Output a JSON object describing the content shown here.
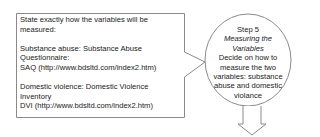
{
  "callout_box": {
    "intro": "State exactly how the variables will be measured:",
    "substance": {
      "line1": "Substance abuse: Substance Abuse",
      "line2": "Questionnaire:",
      "line3": "SAQ (http://www.bdsltd.com/index2.htm)"
    },
    "violence": {
      "line1": "Domestic violence: Domestic Violence",
      "line2": "Inventory",
      "line3": "DVI (http://www.bdsltd.com/index2.htm)"
    }
  },
  "step": {
    "number": "Step 5",
    "title_line1": "Measuring the",
    "title_line2": "Variables",
    "desc_line1": "Decide on how to",
    "desc_line2": "measure the two",
    "desc_line3": "variables: substance",
    "desc_line4": "abuse and domestic",
    "desc_line5": "violance"
  },
  "icons": {
    "down_arrow": "down-arrow-icon"
  },
  "colors": {
    "stroke": "#8a8a8a",
    "text": "#222222",
    "background": "#ffffff"
  }
}
